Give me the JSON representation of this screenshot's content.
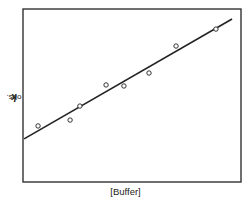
{
  "chart_data": {
    "type": "scatter",
    "title": "",
    "xlabel": "[Buffer]",
    "ylabel": "k obs.",
    "ylabel_parts": {
      "symbol": "k",
      "subscript": "obs."
    },
    "xlim": [
      0,
      100
    ],
    "ylim": [
      0,
      100
    ],
    "ticks": "none",
    "grid": false,
    "legend": null,
    "units_note": "Axes unlabeled with ticks; values are normalized 0-100 positions within the plot frame.",
    "series": [
      {
        "name": "observed",
        "marker": "open-circle",
        "x": [
          6.9,
          21.6,
          26.1,
          38.1,
          46.3,
          57.8,
          70.2,
          88.5
        ],
        "y": [
          32.4,
          35.8,
          43.9,
          56.1,
          55.5,
          63.0,
          78.6,
          88.4
        ]
      },
      {
        "name": "linear fit",
        "style": "solid-line",
        "x": [
          0.5,
          95.9
        ],
        "y": [
          24.9,
          94.2
        ]
      }
    ]
  },
  "frame": {
    "left": 23,
    "top": 9,
    "right": 241,
    "bottom": 182,
    "color": "#333333"
  },
  "colors": {
    "line": "#222222",
    "marker_stroke": "#333333",
    "background": "#ffffff"
  }
}
